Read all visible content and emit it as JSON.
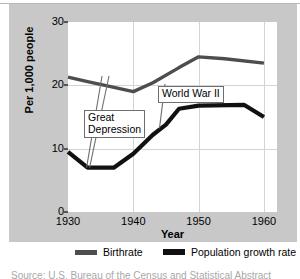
{
  "chart_data": {
    "type": "line",
    "title": "",
    "xlabel": "Year",
    "ylabel": "Per 1,000 people",
    "xlim": [
      1930,
      1962
    ],
    "ylim": [
      0,
      30
    ],
    "xticks": [
      1930,
      1940,
      1950,
      1960
    ],
    "yticks": [
      0,
      10,
      20,
      30
    ],
    "xtick_labels": [
      "1930",
      "1940",
      "1950",
      "1960"
    ],
    "ytick_labels": [
      "0",
      "10",
      "20",
      "30"
    ],
    "grid": true,
    "legend_position": "below",
    "series": [
      {
        "name": "Birthrate",
        "color": "#4d4d4d",
        "x": [
          1930,
          1933,
          1936,
          1940,
          1943,
          1947,
          1950,
          1954,
          1960
        ],
        "values": [
          21.3,
          20.6,
          19.9,
          19.0,
          20.4,
          22.8,
          24.5,
          24.2,
          23.5
        ]
      },
      {
        "name": "Population growth rate",
        "color": "#111111",
        "x": [
          1930,
          1933,
          1937,
          1940,
          1943,
          1945,
          1947,
          1950,
          1957,
          1960
        ],
        "values": [
          9.5,
          7.0,
          7.0,
          9.2,
          12.2,
          13.8,
          16.3,
          16.8,
          16.9,
          15.0
        ]
      }
    ],
    "annotations": [
      {
        "label": "Great Depression",
        "lines": [
          "Great",
          "Depression"
        ],
        "points_to_x": 1933,
        "points_to_y": 7.0
      },
      {
        "label": "World War II",
        "lines": [
          "World War II"
        ],
        "points_to_x": 1944,
        "points_to_y": 13.2
      }
    ]
  },
  "legend": {
    "entries": [
      {
        "label": "Birthrate",
        "color": "#4d4d4d"
      },
      {
        "label": "Population growth rate",
        "color": "#111111"
      }
    ]
  },
  "source_note": "Source: U.S. Bureau of the Census and Statistical Abstract",
  "colors": {
    "panel_background": "#c8c8c8",
    "plot_background": "#ffffff",
    "gridline": "#d4d4d4",
    "birthrate": "#4d4d4d",
    "population_growth": "#111111"
  }
}
